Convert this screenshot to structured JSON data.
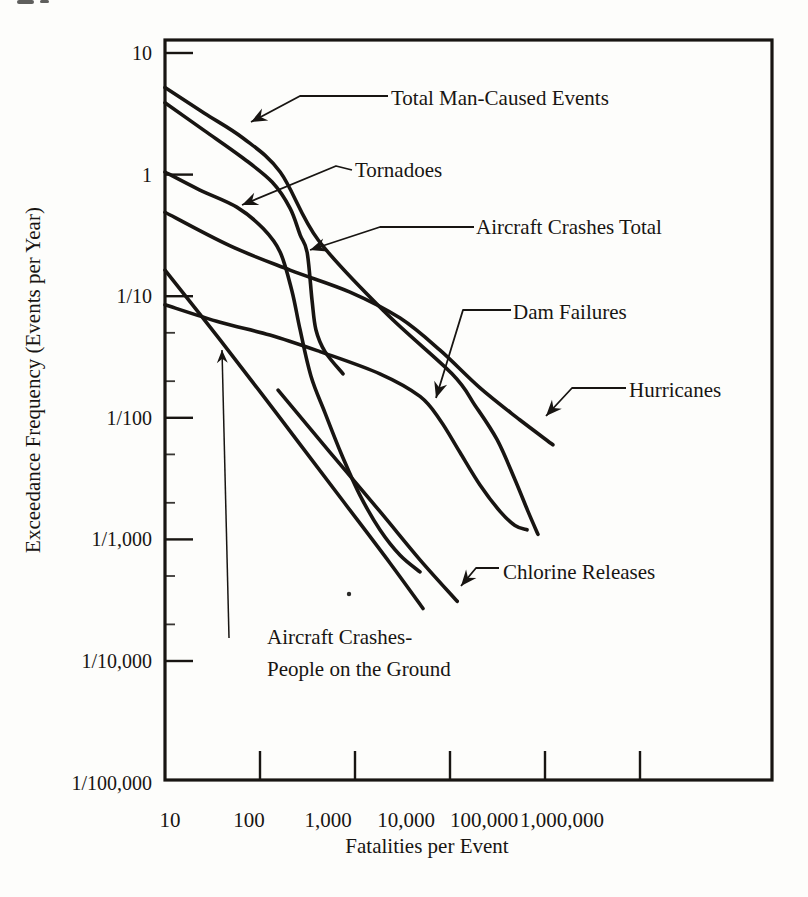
{
  "figure": {
    "kind": "scanned log-log frequency-consequence (F-N) risk figure",
    "colors": {
      "ink": "#181512",
      "paper": "#fdfdfb"
    }
  },
  "annotations": {
    "total_man_caused": {
      "text": "Total Man-Caused Events"
    },
    "tornadoes": {
      "text": "Tornadoes"
    },
    "aircraft_total": {
      "text": "Aircraft Crashes Total"
    },
    "dam_failures": {
      "text": "Dam Failures"
    },
    "hurricanes": {
      "text": "Hurricanes"
    },
    "chlorine": {
      "text": "Chlorine Releases"
    },
    "aircraft_ground": {
      "line1": "Aircraft Crashes-",
      "line2": "People on the Ground"
    }
  },
  "chart_data": {
    "type": "line",
    "title": "",
    "xlabel": "Fatalities per Event",
    "ylabel": "Exceedance Frequency (Events per Year)",
    "x_scale": "log",
    "y_scale": "log",
    "xlim": [
      10,
      25000000
    ],
    "ylim": [
      1e-05,
      12
    ],
    "grid": false,
    "legend": "arrow-annotated labels, no legend box",
    "x_ticks": [
      {
        "value": 10,
        "label": "10"
      },
      {
        "value": 100,
        "label": "100"
      },
      {
        "value": 1000,
        "label": "1,000"
      },
      {
        "value": 10000,
        "label": "10,000"
      },
      {
        "value": 100000,
        "label": "100,000"
      },
      {
        "value": 1000000,
        "label": "1,000,000"
      }
    ],
    "y_ticks": [
      {
        "value": 10,
        "label": "10"
      },
      {
        "value": 1,
        "label": "1"
      },
      {
        "value": 0.1,
        "label": "1/10"
      },
      {
        "value": 0.01,
        "label": "1/100"
      },
      {
        "value": 0.001,
        "label": "1/1,000"
      },
      {
        "value": 0.0001,
        "label": "1/10,000"
      },
      {
        "value": 1e-05,
        "label": "1/100,000"
      }
    ],
    "y_minor_ticks": [
      0.05,
      0.02,
      0.005,
      0.002,
      0.0005,
      0.0002
    ],
    "series": [
      {
        "id": "total_man_caused",
        "name": "Total Man-Caused Events",
        "points": [
          [
            10,
            5.2
          ],
          [
            26,
            3.2
          ],
          [
            66,
            2.0
          ],
          [
            163,
            1.05
          ],
          [
            410,
            0.29
          ],
          [
            2100,
            0.073
          ],
          [
            10500,
            0.023
          ],
          [
            18300,
            0.0127
          ],
          [
            31300,
            0.0066
          ],
          [
            48300,
            0.0031
          ],
          [
            66200,
            0.0017
          ],
          [
            84300,
            0.0011
          ]
        ]
      },
      {
        "id": "aircraft_total",
        "name": "Aircraft Crashes Total",
        "points": [
          [
            10,
            3.9
          ],
          [
            26,
            2.3
          ],
          [
            66,
            1.37
          ],
          [
            134,
            0.87
          ],
          [
            207,
            0.53
          ],
          [
            264,
            0.32
          ],
          [
            313,
            0.23
          ],
          [
            353,
            0.093
          ],
          [
            388,
            0.053
          ],
          [
            483,
            0.035
          ],
          [
            748,
            0.023
          ]
        ]
      },
      {
        "id": "tornadoes",
        "name": "Tornadoes",
        "points": [
          [
            10,
            1.05
          ],
          [
            23,
            0.75
          ],
          [
            57,
            0.54
          ],
          [
            108,
            0.36
          ],
          [
            163,
            0.23
          ],
          [
            217,
            0.11
          ],
          [
            264,
            0.053
          ],
          [
            344,
            0.022
          ],
          [
            483,
            0.011
          ],
          [
            730,
            0.0049
          ],
          [
            1130,
            0.0023
          ],
          [
            1830,
            0.0012
          ],
          [
            2980,
            0.00074
          ],
          [
            4830,
            0.00054
          ]
        ]
      },
      {
        "id": "hurricanes",
        "name": "Hurricanes",
        "points": [
          [
            10,
            0.49
          ],
          [
            48,
            0.26
          ],
          [
            207,
            0.164
          ],
          [
            886,
            0.108
          ],
          [
            2980,
            0.066
          ],
          [
            7850,
            0.036
          ],
          [
            20700,
            0.0176
          ],
          [
            54600,
            0.0096
          ],
          [
            121000,
            0.006
          ]
        ]
      },
      {
        "id": "dam_failures",
        "name": "Dam Failures",
        "points": [
          [
            10,
            0.085
          ],
          [
            38,
            0.061
          ],
          [
            127,
            0.048
          ],
          [
            428,
            0.035
          ],
          [
            1830,
            0.023
          ],
          [
            4830,
            0.015
          ],
          [
            7850,
            0.0096
          ],
          [
            12700,
            0.0052
          ],
          [
            20700,
            0.0028
          ],
          [
            33600,
            0.0017
          ],
          [
            48300,
            0.0013
          ],
          [
            64700,
            0.0012
          ]
        ]
      },
      {
        "id": "aircraft_ground",
        "name": "Aircraft Crashes-People on the Ground",
        "points": [
          [
            10,
            0.164
          ],
          [
            38,
            0.0437
          ],
          [
            163,
            0.00995
          ],
          [
            695,
            0.00223
          ],
          [
            2330,
            0.00064
          ],
          [
            5200,
            0.00027
          ]
        ]
      },
      {
        "id": "chlorine",
        "name": "Chlorine Releases",
        "points": [
          [
            155,
            0.0169
          ],
          [
            546,
            0.0052
          ],
          [
            1830,
            0.0017
          ],
          [
            4830,
            0.00068
          ],
          [
            11900,
            0.00031
          ]
        ]
      }
    ]
  }
}
